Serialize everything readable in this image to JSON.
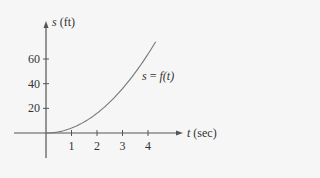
{
  "chart_data": {
    "type": "line",
    "title": "",
    "xlabel": "t (sec)",
    "ylabel": "s (ft)",
    "x_var": "t",
    "x_unit": "(sec)",
    "y_var": "s",
    "y_unit": "(ft)",
    "x_ticks": [
      "1",
      "2",
      "3",
      "4"
    ],
    "y_ticks": [
      "20",
      "40",
      "60"
    ],
    "xlim": [
      -1,
      6
    ],
    "ylim": [
      -20,
      90
    ],
    "grid": false,
    "legend": "none",
    "annotations": [
      {
        "text": "s = f(t)",
        "near_x": 4.0,
        "near_y": 48
      }
    ],
    "series": [
      {
        "name": "s = f(t)",
        "x": [
          0,
          0.5,
          1,
          1.5,
          2,
          2.5,
          3,
          3.5,
          4,
          4.3
        ],
        "values": [
          0,
          1,
          4,
          9,
          16,
          25,
          36,
          49,
          64,
          74
        ]
      }
    ]
  },
  "labels": {
    "curve_label_s": "s",
    "curve_label_eq": "=",
    "curve_label_f": "f",
    "curve_label_t": "(t)"
  }
}
